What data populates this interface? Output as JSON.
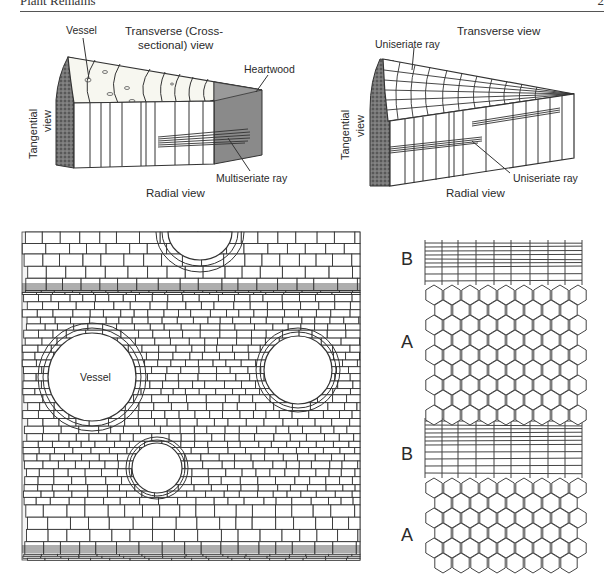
{
  "header": {
    "running_title": "Plant Remains",
    "page_number": "2"
  },
  "figure_top_left": {
    "title_line1": "Transverse (Cross-",
    "title_line2": "sectional) view",
    "vessel": "Vessel",
    "heartwood": "Heartwood",
    "tangential_line1": "Tangential",
    "tangential_line2": "view",
    "radial": "Radial view",
    "ray": "Multiseriate ray"
  },
  "figure_top_right": {
    "title": "Transverse view",
    "ray_top": "Uniseriate ray",
    "tangential_line1": "Tangential",
    "tangential_line2": "view",
    "radial": "Radial view",
    "ray_bottom": "Uniseriate ray"
  },
  "figure_bottom_left": {
    "vessel": "Vessel"
  },
  "figure_bottom_right": {
    "labels": [
      "B",
      "A",
      "B",
      "A"
    ]
  }
}
